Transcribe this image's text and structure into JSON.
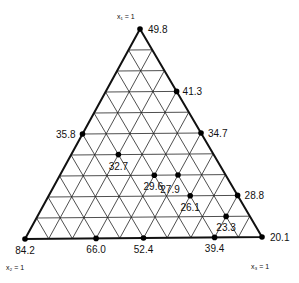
{
  "diagram": {
    "type": "ternary",
    "vertices": {
      "top": {
        "label": "x₁ = 1",
        "value": "49.8"
      },
      "bottom_left": {
        "label": "x₂ = 1",
        "value": "84.2"
      },
      "bottom_right": {
        "label": "x₃ = 1",
        "value": "20.1"
      }
    },
    "grid_divisions": 10,
    "points": [
      {
        "value": "49.8",
        "a": 10,
        "b": 0,
        "c": 0
      },
      {
        "value": "41.3",
        "a": 7,
        "b": 0,
        "c": 3
      },
      {
        "value": "34.7",
        "a": 5,
        "b": 0,
        "c": 5
      },
      {
        "value": "28.8",
        "a": 2,
        "b": 0,
        "c": 8
      },
      {
        "value": "20.1",
        "a": 0,
        "b": 0,
        "c": 10
      },
      {
        "value": "35.8",
        "a": 5,
        "b": 5,
        "c": 0
      },
      {
        "value": "84.2",
        "a": 0,
        "b": 10,
        "c": 0
      },
      {
        "value": "66.0",
        "a": 0,
        "b": 7,
        "c": 3
      },
      {
        "value": "52.4",
        "a": 0,
        "b": 5,
        "c": 5
      },
      {
        "value": "39.4",
        "a": 0,
        "b": 2,
        "c": 8
      },
      {
        "value": "32.7",
        "a": 4,
        "b": 4,
        "c": 2
      },
      {
        "value": "29.6",
        "a": 3,
        "b": 3,
        "c": 4
      },
      {
        "value": "27.9",
        "a": 3,
        "b": 2,
        "c": 5
      },
      {
        "value": "26.1",
        "a": 2,
        "b": 2,
        "c": 6
      },
      {
        "value": "23.3",
        "a": 1,
        "b": 1,
        "c": 8
      }
    ]
  }
}
